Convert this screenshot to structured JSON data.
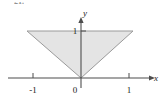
{
  "figure": {
    "number_label": "21.",
    "background_color": "#ffffff",
    "width": 164,
    "height": 102
  },
  "axes": {
    "x_axis_label": "x",
    "y_axis_label": "y",
    "axis_color": "#4d4d4d",
    "x_ticks": [
      {
        "value": -1,
        "label": "-1"
      },
      {
        "value": 1,
        "label": "1"
      }
    ],
    "y_ticks": [
      {
        "value": 1,
        "label": "1"
      }
    ],
    "origin_label": "0",
    "x_range": [
      -2.3,
      2.2
    ],
    "y_range": [
      -0.3,
      1.8
    ]
  },
  "shape": {
    "name": "inverted-triangle",
    "type": "polygon",
    "fill_color": "#e4e4e4",
    "stroke_color": "#9a9a9a",
    "vertices": [
      {
        "x": -1.5,
        "y": 1
      },
      {
        "x": 1.5,
        "y": 1
      },
      {
        "x": 0,
        "y": 0
      }
    ]
  }
}
